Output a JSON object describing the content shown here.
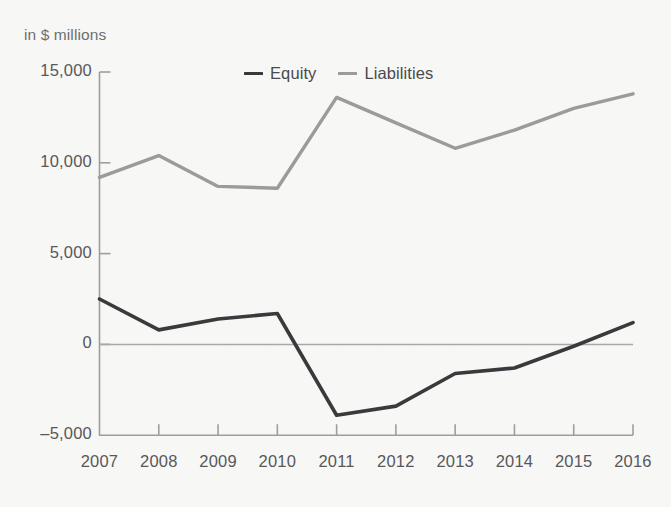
{
  "title_partial": "·",
  "axis_unit": "in $ millions",
  "legend": {
    "items": [
      {
        "label": "Equity",
        "color": "#3a3a3c"
      },
      {
        "label": "Liabilities",
        "color": "#9b9b9b"
      }
    ]
  },
  "colors": {
    "background": "#f7f7f6",
    "axis": "#9e9e9e",
    "zero_line": "#a8a8a8",
    "equity": "#3a3a3c",
    "liabilities": "#9b9b9b",
    "tick_text": "#58585a",
    "unit_text": "#6e6e6e"
  },
  "chart_data": {
    "type": "line",
    "title": "",
    "subtitle": "in $ millions",
    "xlabel": "",
    "ylabel": "in $ millions",
    "x": [
      "2007",
      "2008",
      "2009",
      "2010",
      "2011",
      "2012",
      "2013",
      "2014",
      "2015",
      "2016"
    ],
    "categories": [
      "2007",
      "2008",
      "2009",
      "2010",
      "2011",
      "2012",
      "2013",
      "2014",
      "2015",
      "2016"
    ],
    "series": [
      {
        "name": "Equity",
        "color": "#3a3a3c",
        "values": [
          2500,
          800,
          1400,
          1700,
          -3900,
          -3400,
          -1600,
          -1300,
          -100,
          1200
        ]
      },
      {
        "name": "Liabilities",
        "color": "#9b9b9b",
        "values": [
          9200,
          10400,
          8700,
          8600,
          13600,
          12200,
          10800,
          11800,
          13000,
          13800
        ]
      }
    ],
    "ylim": [
      -5000,
      15000
    ],
    "yticks": [
      15000,
      10000,
      5000,
      0,
      -5000
    ],
    "ytick_labels": [
      "15,000",
      "10,000",
      "5,000",
      "0",
      "-5,000"
    ],
    "grid": false,
    "zero_line": true,
    "legend_position": "top-center"
  }
}
